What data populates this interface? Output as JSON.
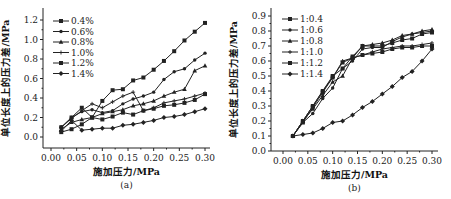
{
  "chart_data": [
    {
      "type": "line",
      "caption": "(a)",
      "title": "",
      "xlabel": "施加压力/MPa",
      "ylabel": "单位长度上的压力差/MPa",
      "xlim": [
        0.0,
        0.3
      ],
      "ylim": [
        -0.05,
        1.25
      ],
      "xticks": [
        "0.00",
        "0.05",
        "0.10",
        "0.15",
        "0.20",
        "0.25",
        "0.30"
      ],
      "yticks": [
        "0.0",
        "0.2",
        "0.4",
        "0.6",
        "0.8",
        "1.0",
        "1.2"
      ],
      "grid": false,
      "legend_position": "upper-left",
      "x": [
        0.02,
        0.04,
        0.06,
        0.08,
        0.1,
        0.12,
        0.14,
        0.16,
        0.18,
        0.2,
        0.22,
        0.24,
        0.26,
        0.28,
        0.3
      ],
      "series": [
        {
          "name": "0.4%",
          "marker": "square",
          "values": [
            0.1,
            0.2,
            0.3,
            0.2,
            0.37,
            0.48,
            0.49,
            0.58,
            0.61,
            0.69,
            0.78,
            0.88,
            0.99,
            1.08,
            1.17
          ]
        },
        {
          "name": "0.6%",
          "marker": "dot",
          "values": [
            0.1,
            0.2,
            0.26,
            0.28,
            0.25,
            0.27,
            0.34,
            0.39,
            0.42,
            0.46,
            0.59,
            0.67,
            0.7,
            0.79,
            0.86
          ]
        },
        {
          "name": "0.8%",
          "marker": "triangle",
          "values": [
            0.08,
            0.15,
            0.18,
            0.2,
            0.24,
            0.26,
            0.28,
            0.32,
            0.34,
            0.37,
            0.42,
            0.46,
            0.49,
            0.68,
            0.73
          ]
        },
        {
          "name": "1.0%",
          "marker": "cross",
          "values": [
            0.1,
            0.19,
            0.27,
            0.34,
            0.3,
            0.36,
            0.42,
            0.46,
            0.27,
            0.3,
            0.35,
            0.37,
            0.39,
            0.42,
            0.45
          ]
        },
        {
          "name": "1.2%",
          "marker": "square",
          "values": [
            0.05,
            0.08,
            0.13,
            0.2,
            0.18,
            0.21,
            0.25,
            0.23,
            0.27,
            0.29,
            0.32,
            0.33,
            0.35,
            0.38,
            0.44
          ]
        },
        {
          "name": "1.4%",
          "marker": "diamond",
          "values": [
            0.06,
            0.17,
            0.07,
            0.08,
            0.09,
            0.09,
            0.12,
            0.13,
            0.15,
            0.17,
            0.2,
            0.21,
            0.23,
            0.26,
            0.29
          ]
        }
      ]
    },
    {
      "type": "line",
      "caption": "(b)",
      "title": "",
      "xlabel": "施加压力/MPa",
      "ylabel": "单位长度上的压力差/MPa",
      "xlim": [
        0.0,
        0.3
      ],
      "ylim": [
        0.0,
        0.9
      ],
      "xticks": [
        "0.00",
        "0.05",
        "0.10",
        "0.15",
        "0.20",
        "0.25",
        "0.30"
      ],
      "yticks": [
        "0.0",
        "0.1",
        "0.2",
        "0.3",
        "0.4",
        "0.5",
        "0.6",
        "0.7",
        "0.8",
        "0.9"
      ],
      "grid": false,
      "legend_position": "upper-left",
      "x": [
        0.02,
        0.04,
        0.06,
        0.08,
        0.1,
        0.12,
        0.14,
        0.16,
        0.18,
        0.2,
        0.22,
        0.24,
        0.26,
        0.28,
        0.3
      ],
      "series": [
        {
          "name": "1:0.4",
          "marker": "square",
          "values": [
            0.1,
            0.2,
            0.3,
            0.4,
            0.5,
            0.55,
            0.63,
            0.7,
            0.7,
            0.7,
            0.72,
            0.74,
            0.75,
            0.78,
            0.79
          ]
        },
        {
          "name": "1:0.6",
          "marker": "dot",
          "values": [
            0.1,
            0.19,
            0.25,
            0.35,
            0.42,
            0.55,
            0.6,
            0.68,
            0.69,
            0.69,
            0.73,
            0.76,
            0.78,
            0.79,
            0.8
          ]
        },
        {
          "name": "1:0.8",
          "marker": "triangle",
          "values": [
            0.1,
            0.2,
            0.28,
            0.37,
            0.46,
            0.5,
            0.62,
            0.7,
            0.71,
            0.72,
            0.74,
            0.77,
            0.78,
            0.8,
            0.81
          ]
        },
        {
          "name": "1:1.0",
          "marker": "cross",
          "values": [
            0.1,
            0.2,
            0.3,
            0.4,
            0.49,
            0.6,
            0.62,
            0.64,
            0.66,
            0.68,
            0.69,
            0.7,
            0.7,
            0.71,
            0.72
          ]
        },
        {
          "name": "1:1.2",
          "marker": "square",
          "values": [
            0.1,
            0.19,
            0.29,
            0.39,
            0.49,
            0.59,
            0.62,
            0.64,
            0.65,
            0.66,
            0.68,
            0.69,
            0.69,
            0.7,
            0.7
          ]
        },
        {
          "name": "1:1.4",
          "marker": "diamond",
          "values": [
            0.1,
            0.11,
            0.12,
            0.15,
            0.19,
            0.2,
            0.24,
            0.29,
            0.33,
            0.38,
            0.43,
            0.49,
            0.53,
            0.6,
            0.68
          ]
        }
      ]
    }
  ],
  "charts_layout": [
    {
      "plot": {
        "left": 43,
        "top": 8,
        "right": 210,
        "bottom": 148
      },
      "x0px": 51,
      "x1px": 205,
      "y0val": 0.0,
      "y0px": 137,
      "y1val": 1.2,
      "y1px": 20,
      "legend": {
        "x": 53,
        "y": 21,
        "dy": 10.5
      }
    },
    {
      "plot": {
        "left": 271,
        "top": 8,
        "right": 438,
        "bottom": 151
      },
      "x0px": 283,
      "x1px": 432,
      "y0val": 0.0,
      "y0px": 151,
      "y1val": 0.9,
      "y1px": 16,
      "legend": {
        "x": 282,
        "y": 19,
        "dy": 11
      }
    }
  ]
}
